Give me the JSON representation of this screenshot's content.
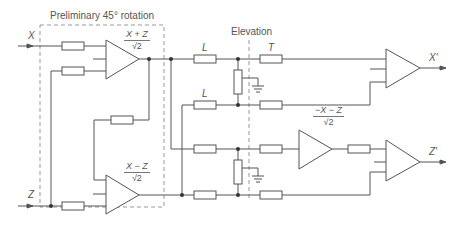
{
  "diagram": {
    "section_title": "Preliminary 45° rotation",
    "elevation_label": "Elevation",
    "inputs": {
      "x": "X",
      "z": "Z"
    },
    "outputs": {
      "x": "X′",
      "z": "Z′"
    },
    "resistor_labels": {
      "l_top": "L",
      "l_mid": "L",
      "t": "T"
    },
    "amp1": {
      "num": "X + Z",
      "den": "√2"
    },
    "amp2": {
      "num": "X − Z",
      "den": "√2"
    },
    "amp3": {
      "num": "−X − Z",
      "den": "√2"
    },
    "colors": {
      "line": "#555555",
      "dashed": "#999999",
      "text": "#555555"
    }
  }
}
